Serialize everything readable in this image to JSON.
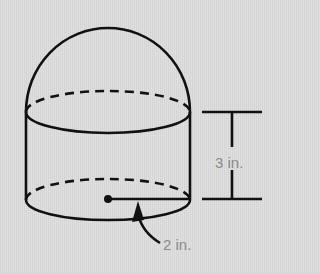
{
  "figure": {
    "shape": "cylinder with hemisphere on top",
    "labels": {
      "height": "3 in.",
      "radius": "2 in."
    },
    "colors": {
      "background": "#dedede",
      "stroke": "#111111",
      "label_text": "#8a8a8a"
    }
  }
}
